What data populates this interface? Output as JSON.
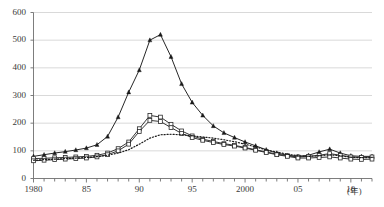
{
  "chart_data": {
    "type": "line",
    "title": "",
    "subtitle": "",
    "xlabel": "(年)",
    "ylabel": "",
    "xlim": [
      1980,
      2012
    ],
    "ylim": [
      0,
      600
    ],
    "grid": true,
    "legend_position": "none",
    "y_ticks": [
      0,
      100,
      200,
      300,
      400,
      500,
      600
    ],
    "y_tick_labels": [
      "0",
      "100",
      "200",
      "300",
      "400",
      "500",
      "600"
    ],
    "x_ticks": [
      1980,
      1981,
      1982,
      1983,
      1984,
      1985,
      1986,
      1987,
      1988,
      1989,
      1990,
      1991,
      1992,
      1993,
      1994,
      1995,
      1996,
      1997,
      1998,
      1999,
      2000,
      2001,
      2002,
      2003,
      2004,
      2005,
      2006,
      2007,
      2008,
      2009,
      2010,
      2011,
      2012
    ],
    "x_tick_labels": [
      "1980",
      "",
      "",
      "",
      "",
      "85",
      "",
      "",
      "",
      "",
      "90",
      "",
      "",
      "",
      "",
      "95",
      "",
      "",
      "",
      "",
      "2000",
      "",
      "",
      "",
      "",
      "05",
      "",
      "",
      "",
      "",
      "10",
      "",
      ""
    ],
    "x": [
      1980,
      1981,
      1982,
      1983,
      1984,
      1985,
      1986,
      1987,
      1988,
      1989,
      1990,
      1991,
      1992,
      1993,
      1994,
      1995,
      1996,
      1997,
      1998,
      1999,
      2000,
      2001,
      2002,
      2003,
      2004,
      2005,
      2006,
      2007,
      2008,
      2009,
      2010,
      2011,
      2012
    ],
    "series": [
      {
        "name": "series-triangle",
        "marker": "filled-triangle",
        "linestyle": "solid",
        "color": "#1a1a1a",
        "values": [
          80,
          86,
          92,
          97,
          103,
          110,
          122,
          152,
          222,
          312,
          392,
          500,
          520,
          440,
          342,
          275,
          228,
          190,
          165,
          148,
          132,
          118,
          104,
          92,
          84,
          80,
          84,
          96,
          106,
          92,
          82,
          80,
          80
        ]
      },
      {
        "name": "series-square-upper",
        "marker": "open-square",
        "linestyle": "solid",
        "color": "#2a2a2a",
        "values": [
          72,
          73,
          75,
          76,
          78,
          80,
          84,
          92,
          108,
          132,
          180,
          228,
          222,
          196,
          172,
          154,
          142,
          134,
          126,
          120,
          112,
          104,
          96,
          88,
          82,
          78,
          80,
          84,
          90,
          84,
          78,
          76,
          78
        ]
      },
      {
        "name": "series-square-lower",
        "marker": "open-square",
        "linestyle": "solid",
        "color": "#2a2a2a",
        "values": [
          64,
          66,
          68,
          70,
          72,
          74,
          78,
          86,
          100,
          124,
          170,
          210,
          206,
          184,
          163,
          148,
          138,
          130,
          123,
          117,
          110,
          102,
          94,
          86,
          80,
          74,
          74,
          76,
          78,
          74,
          70,
          69,
          70
        ]
      },
      {
        "name": "series-dotted",
        "marker": "none",
        "linestyle": "dotted",
        "color": "#1a1a1a",
        "values": [
          66,
          68,
          70,
          72,
          74,
          76,
          79,
          84,
          92,
          104,
          124,
          146,
          158,
          160,
          158,
          154,
          150,
          146,
          140,
          133,
          124,
          114,
          104,
          95,
          88,
          82,
          80,
          82,
          86,
          82,
          77,
          75,
          76
        ]
      }
    ]
  },
  "axis": {
    "x_unit_label": "(年)"
  }
}
